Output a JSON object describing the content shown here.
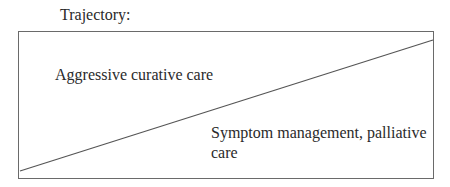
{
  "diagram": {
    "title": "Trajectory:",
    "regions": {
      "upper": {
        "label": "Aggressive curative care"
      },
      "lower": {
        "label": "Symptom management, palliative care"
      }
    },
    "divider": {
      "from": [
        20,
        171
      ],
      "to": [
        433,
        40
      ],
      "color": "#555555"
    },
    "box_border_color": "#6a6a6a"
  }
}
